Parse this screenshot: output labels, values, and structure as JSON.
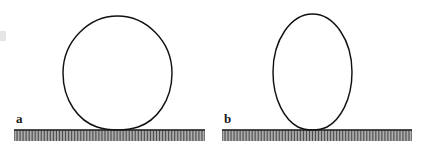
{
  "figure": {
    "type": "scientific-line-figure",
    "background_color": "#ffffff",
    "outline_color": "#111111",
    "label_color": "#1a1a1a",
    "hatch_color": "#2a2a2a",
    "width": 430,
    "height": 146
  },
  "panels": [
    {
      "label": "a",
      "label_x": 16,
      "label_y": 123,
      "description": "wide flattened drop with large contact area and lower contact angle",
      "drop": {
        "center_x": 117.5,
        "bottom_y": 130,
        "top_y": 16,
        "left_x": 63,
        "right_x": 172,
        "width": 109,
        "height": 114,
        "contact_half_width": 22
      },
      "surface": {
        "line_y": 130,
        "x_start": 14,
        "x_end": 205,
        "tick_bottom_y": 141,
        "tick_count": 128
      }
    },
    {
      "label": "b",
      "label_x": 224,
      "label_y": 123,
      "description": "narrow elongated drop with small contact area and higher contact angle",
      "drop": {
        "center_x": 312.5,
        "bottom_y": 130,
        "top_y": 14,
        "left_x": 273,
        "right_x": 352,
        "width": 79,
        "height": 116,
        "contact_half_width": 9
      },
      "surface": {
        "line_y": 130,
        "x_start": 222,
        "x_end": 412,
        "tick_bottom_y": 141,
        "tick_count": 127
      }
    }
  ],
  "edge_artifact": {
    "present": true,
    "x": 0,
    "y": 31,
    "width": 6,
    "height": 10,
    "note": "faint cropped mark at left image border"
  }
}
